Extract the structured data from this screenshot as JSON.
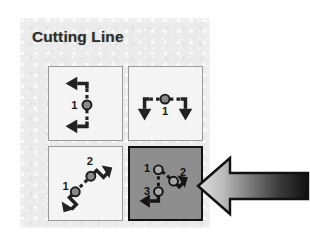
{
  "panel": {
    "title": "Cutting Line",
    "background_color": "#ebebeb",
    "selected_index": 3
  },
  "buttons": [
    {
      "name": "cutting-line-vertical",
      "label": "Cutting Line Vertical",
      "point_labels": [
        "1"
      ],
      "selected": false
    },
    {
      "name": "cutting-line-horizontal",
      "label": "Cutting Line Horizontal",
      "point_labels": [
        "1"
      ],
      "selected": false
    },
    {
      "name": "cutting-line-two-point",
      "label": "Cutting Line Two Point",
      "point_labels": [
        "1",
        "2"
      ],
      "selected": false
    },
    {
      "name": "cutting-line-three-point",
      "label": "Cutting Line Three Point",
      "point_labels": [
        "1",
        "2",
        "3"
      ],
      "selected": true
    }
  ],
  "annotation": {
    "arrow_name": "callout-arrow-left",
    "direction": "left",
    "gradient_from": "#d9d9d9",
    "gradient_to": "#101010",
    "outline_color": "#111111"
  }
}
